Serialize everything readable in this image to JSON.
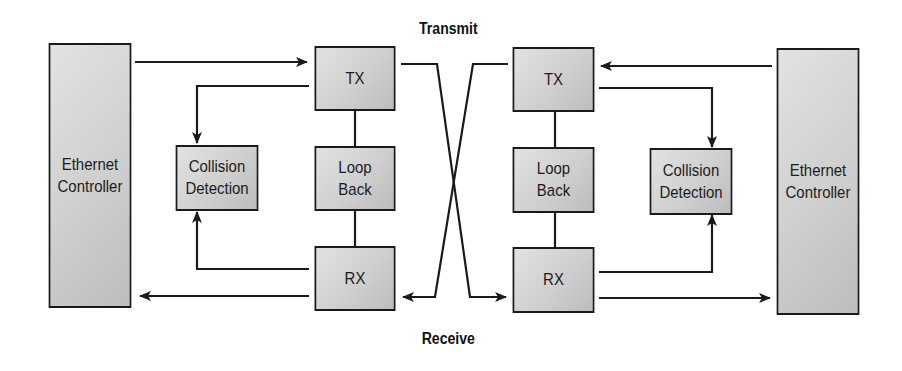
{
  "diagram": {
    "top_label": "Transmit",
    "bottom_label": "Receive",
    "left": {
      "controller": {
        "line1": "Ethernet",
        "line2": "Controller"
      },
      "collision": {
        "line1": "Collision",
        "line2": "Detection"
      },
      "tx": "TX",
      "loopback": {
        "line1": "Loop",
        "line2": "Back"
      },
      "rx": "RX"
    },
    "right": {
      "controller": {
        "line1": "Ethernet",
        "line2": "Controller"
      },
      "collision": {
        "line1": "Collision",
        "line2": "Detection"
      },
      "tx": "TX",
      "loopback": {
        "line1": "Loop",
        "line2": "Back"
      },
      "rx": "RX"
    },
    "colors": {
      "line": "#1a1a1a",
      "box_fill": "#cfcfcf"
    }
  }
}
